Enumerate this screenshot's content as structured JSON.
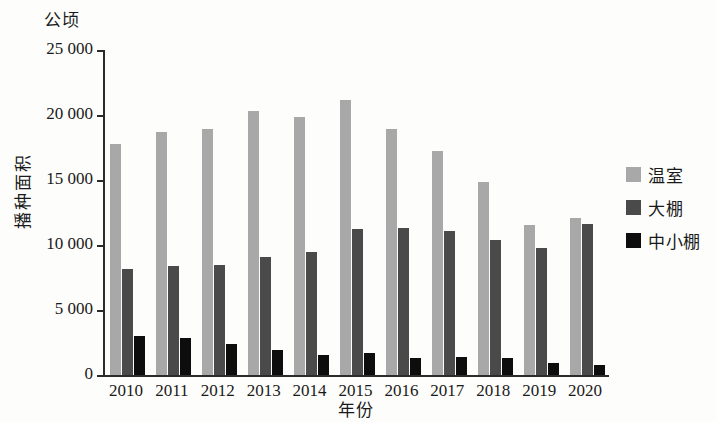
{
  "chart_data": {
    "type": "bar",
    "title": "",
    "units_label": "公顷",
    "ylabel": "播种面积",
    "xlabel": "年份",
    "categories": [
      "2010",
      "2011",
      "2012",
      "2013",
      "2014",
      "2015",
      "2016",
      "2017",
      "2018",
      "2019",
      "2020"
    ],
    "ylim": [
      0,
      25000
    ],
    "ytick_values": [
      0,
      5000,
      10000,
      15000,
      20000,
      25000
    ],
    "ytick_labels": [
      "0",
      "5 000",
      "10 000",
      "15 000",
      "20 000",
      "25 000"
    ],
    "grid": false,
    "legend_position": "right",
    "series": [
      {
        "name": "温室",
        "color": "#a8a8a8",
        "values": [
          17800,
          18700,
          18950,
          20300,
          19850,
          21150,
          18950,
          17200,
          14850,
          11550,
          12050
        ]
      },
      {
        "name": "大棚",
        "color": "#4a4a4a",
        "values": [
          8150,
          8350,
          8500,
          9050,
          9500,
          11200,
          11300,
          11100,
          10400,
          9750,
          11600
        ]
      },
      {
        "name": "中小棚",
        "color": "#0d0d0d",
        "values": [
          3000,
          2850,
          2400,
          1900,
          1550,
          1700,
          1300,
          1400,
          1300,
          900,
          750
        ]
      }
    ]
  }
}
